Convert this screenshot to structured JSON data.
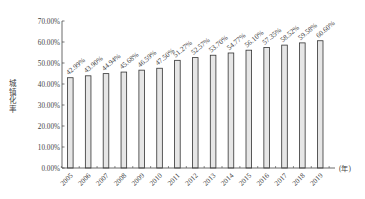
{
  "chart_data": {
    "type": "bar",
    "title": "",
    "xlabel": "(年)",
    "ylabel": "城镇化率",
    "ylim": [
      0,
      70
    ],
    "yticks": [
      "0.00%",
      "10.00%",
      "20.00%",
      "30.00%",
      "40.00%",
      "50.00%",
      "60.00%",
      "70.00%"
    ],
    "categories": [
      "2005",
      "2006",
      "2007",
      "2008",
      "2009",
      "2010",
      "2011",
      "2012",
      "2013",
      "2014",
      "2015",
      "2016",
      "2017",
      "2018",
      "2019"
    ],
    "values": [
      42.99,
      43.9,
      44.94,
      45.68,
      46.59,
      47.5,
      51.27,
      52.57,
      53.7,
      54.77,
      56.1,
      57.35,
      58.52,
      59.58,
      60.6
    ],
    "data_labels": [
      "42.99%",
      "43.90%",
      "44.94%",
      "45.68%",
      "46.59%",
      "47.50%",
      "51.27%",
      "52.57%",
      "53.70%",
      "54.77%",
      "56.10%",
      "57.35%",
      "58.52%",
      "59.58%",
      "60.60%"
    ],
    "grid": false,
    "legend": null,
    "bar_fill": "#e6e6e6",
    "bar_stroke": "#333333"
  }
}
